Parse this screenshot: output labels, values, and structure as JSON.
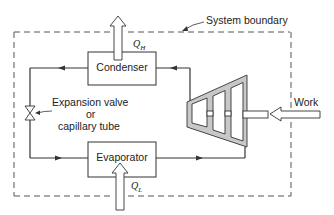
{
  "diagram": {
    "labels": {
      "system_boundary": "System boundary",
      "condenser": "Condenser",
      "evaporator": "Evaporator",
      "expansion_line1": "Expansion valve",
      "expansion_line2": "or",
      "expansion_line3": "capillary tube",
      "work": "Work",
      "q_high": "Q",
      "q_high_sub": "H",
      "q_low": "Q",
      "q_low_sub": "L"
    },
    "components": [
      "Condenser",
      "Evaporator",
      "Expansion valve or capillary tube",
      "Compressor"
    ],
    "flows": [
      {
        "from": "Compressor",
        "to": "Condenser"
      },
      {
        "from": "Condenser",
        "to": "Expansion valve"
      },
      {
        "from": "Expansion valve",
        "to": "Evaporator"
      },
      {
        "from": "Evaporator",
        "to": "Compressor"
      }
    ],
    "energy": [
      {
        "name": "Q_H",
        "direction": "out",
        "at": "Condenser"
      },
      {
        "name": "Q_L",
        "direction": "in",
        "at": "Evaporator"
      },
      {
        "name": "Work",
        "direction": "in",
        "at": "Compressor"
      }
    ],
    "colors": {
      "line": "#333333",
      "compressor_fill": "#c8c8c8",
      "background": "#ffffff"
    }
  }
}
